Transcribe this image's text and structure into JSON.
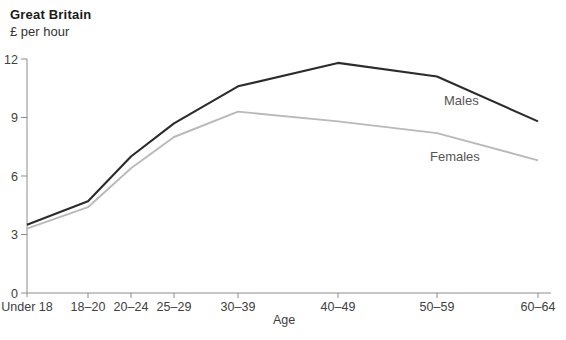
{
  "page": {
    "title": "Great Britain",
    "units": "£ per hour"
  },
  "chart_data": {
    "type": "line",
    "title": "Great Britain",
    "ylabel": "£ per hour",
    "xlabel": "Age",
    "categories": [
      "Under 18",
      "18–20",
      "20–24",
      "25–29",
      "30–39",
      "40–49",
      "50–59",
      "60–64"
    ],
    "series": [
      {
        "name": "Males",
        "values": [
          3.5,
          4.7,
          7.0,
          8.7,
          10.6,
          11.8,
          11.1,
          8.8
        ],
        "color": "#2b2b2b",
        "stroke_width": 2.1,
        "label_pos": {
          "x": 444,
          "y": 105
        }
      },
      {
        "name": "Females",
        "values": [
          3.3,
          4.4,
          6.4,
          8.0,
          9.3,
          8.8,
          8.2,
          6.8
        ],
        "color": "#b9b9b9",
        "stroke_width": 1.9,
        "label_pos": {
          "x": 430,
          "y": 161
        }
      }
    ],
    "yticks": [
      0,
      3,
      6,
      9,
      12
    ],
    "ylim": [
      0,
      12
    ],
    "grid": false,
    "legend_position": "inline-right-of-lines",
    "colors": {
      "axis": "#8c8c8c",
      "tick_text": "#404040",
      "series_label_text": "#555555"
    },
    "layout": {
      "y_axis_x": 27,
      "x_axis_y": 293,
      "x_axis_end": 551,
      "y_top": 59,
      "axis_overhang_below": 4,
      "tick_len": 6,
      "x_positions": [
        27,
        88,
        131,
        174,
        238,
        338,
        437,
        538
      ],
      "x_tick_label_y": 311,
      "xlabel_pos": {
        "x": 284,
        "y": 324
      }
    }
  }
}
